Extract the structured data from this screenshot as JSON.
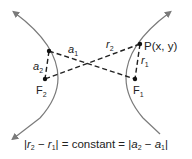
{
  "diagram": {
    "type": "hyperbola-focal-property",
    "colors": {
      "curve": "#7a7a7a",
      "line": "#222222",
      "point": "#111111"
    },
    "labels": {
      "a1": "a",
      "a1_sub": "1",
      "a2": "a",
      "a2_sub": "2",
      "r1": "r",
      "r1_sub": "1",
      "r2": "r",
      "r2_sub": "2",
      "F1": "F",
      "F1_sub": "1",
      "F2": "F",
      "F2_sub": "2",
      "P": "P(x, y)"
    },
    "formula": {
      "lhs_open": "|",
      "r2": "r",
      "r2_sub": "2",
      "minus1": " − ",
      "r1": "r",
      "r1_sub": "1",
      "lhs_close": "| = ",
      "constant": "constant",
      "eq2": " = |",
      "a2": "a",
      "a2_sub": "2",
      "minus2": " − ",
      "a1": "a",
      "a1_sub": "1",
      "rhs_close": "|"
    }
  }
}
